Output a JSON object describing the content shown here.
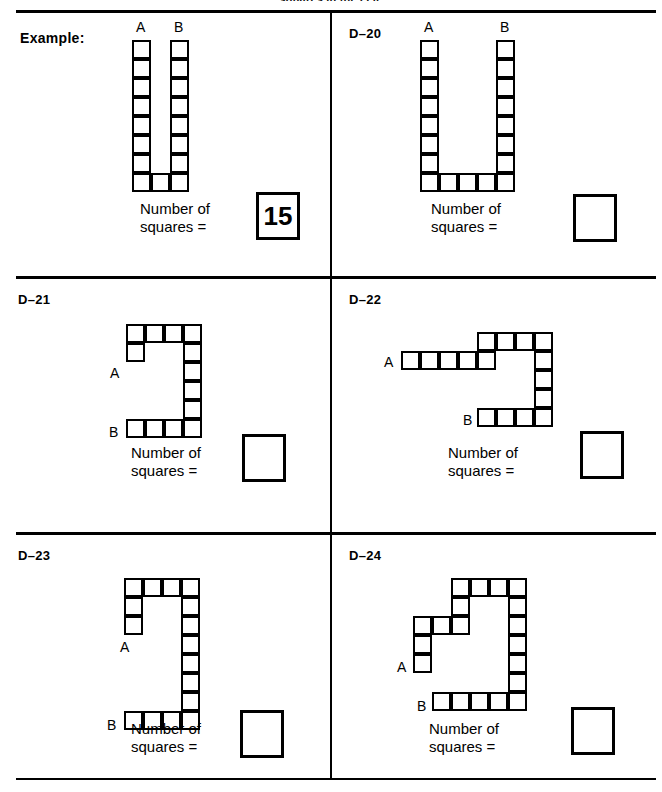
{
  "page": {
    "clipped_header": "squares in the cell.",
    "rule_color": "#000000",
    "paper_color": "#ffffff"
  },
  "prompt_text": "Number of\nsquares =",
  "labels": {
    "a": "A",
    "b": "B"
  },
  "cells": [
    {
      "id": "example",
      "label": "Example:",
      "answer": "15",
      "answer_filled": true,
      "marker_a": "A",
      "marker_b": "B"
    },
    {
      "id": "d20",
      "label": "D–20",
      "answer": "",
      "answer_filled": false,
      "marker_a": "A",
      "marker_b": "B"
    },
    {
      "id": "d21",
      "label": "D–21",
      "answer": "",
      "answer_filled": false,
      "marker_a": "A",
      "marker_b": "B"
    },
    {
      "id": "d22",
      "label": "D–22",
      "answer": "",
      "answer_filled": false,
      "marker_a": "A",
      "marker_b": "B"
    },
    {
      "id": "d23",
      "label": "D–23",
      "answer": "",
      "answer_filled": false,
      "marker_a": "A",
      "marker_b": "B"
    },
    {
      "id": "d24",
      "label": "D–24",
      "answer": "",
      "answer_filled": false,
      "marker_a": "A",
      "marker_b": "B"
    }
  ],
  "chart_data": {
    "type": "table",
    "cell_size_px": 19,
    "figures": [
      {
        "id": "example",
        "label": "Example:",
        "grid_cols": 3,
        "grid_rows": 8,
        "cells": [
          [
            0,
            0
          ],
          [
            0,
            1
          ],
          [
            0,
            2
          ],
          [
            0,
            3
          ],
          [
            0,
            4
          ],
          [
            0,
            5
          ],
          [
            0,
            6
          ],
          [
            0,
            7
          ],
          [
            1,
            7
          ],
          [
            2,
            0
          ],
          [
            2,
            1
          ],
          [
            2,
            2
          ],
          [
            2,
            3
          ],
          [
            2,
            4
          ],
          [
            2,
            5
          ],
          [
            2,
            6
          ],
          [
            2,
            7
          ]
        ],
        "count": 17,
        "answer_shown": "15",
        "marker_a_cell": [
          0,
          0
        ],
        "marker_b_cell": [
          2,
          0
        ]
      },
      {
        "id": "d20",
        "label": "D–20",
        "grid_cols": 5,
        "grid_rows": 8,
        "cells": [
          [
            0,
            0
          ],
          [
            0,
            1
          ],
          [
            0,
            2
          ],
          [
            0,
            3
          ],
          [
            0,
            4
          ],
          [
            0,
            5
          ],
          [
            0,
            6
          ],
          [
            0,
            7
          ],
          [
            1,
            7
          ],
          [
            2,
            7
          ],
          [
            3,
            7
          ],
          [
            4,
            0
          ],
          [
            4,
            1
          ],
          [
            4,
            2
          ],
          [
            4,
            3
          ],
          [
            4,
            4
          ],
          [
            4,
            5
          ],
          [
            4,
            6
          ],
          [
            4,
            7
          ]
        ],
        "count": 19,
        "answer_shown": "",
        "marker_a_cell": [
          0,
          0
        ],
        "marker_b_cell": [
          4,
          0
        ]
      },
      {
        "id": "d21",
        "label": "D–21",
        "grid_cols": 4,
        "grid_rows": 6,
        "cells": [
          [
            0,
            0
          ],
          [
            1,
            0
          ],
          [
            2,
            0
          ],
          [
            3,
            0
          ],
          [
            0,
            1
          ],
          [
            3,
            1
          ],
          [
            3,
            2
          ],
          [
            3,
            3
          ],
          [
            3,
            4
          ],
          [
            0,
            5
          ],
          [
            1,
            5
          ],
          [
            2,
            5
          ],
          [
            3,
            5
          ]
        ],
        "count": 13,
        "answer_shown": "",
        "marker_a_cell": [
          0,
          1
        ],
        "marker_b_cell": [
          0,
          5
        ]
      },
      {
        "id": "d22",
        "label": "D–22",
        "grid_cols": 8,
        "grid_rows": 6,
        "cells": [
          [
            4,
            0
          ],
          [
            5,
            0
          ],
          [
            6,
            0
          ],
          [
            7,
            0
          ],
          [
            0,
            1
          ],
          [
            1,
            1
          ],
          [
            2,
            1
          ],
          [
            3,
            1
          ],
          [
            4,
            1
          ],
          [
            7,
            1
          ],
          [
            7,
            2
          ],
          [
            7,
            3
          ],
          [
            4,
            4
          ],
          [
            5,
            4
          ],
          [
            6,
            4
          ],
          [
            7,
            4
          ]
        ],
        "count": 16,
        "answer_shown": "",
        "marker_a_cell": [
          0,
          1
        ],
        "marker_b_cell": [
          4,
          4
        ]
      },
      {
        "id": "d23",
        "label": "D–23",
        "grid_cols": 4,
        "grid_rows": 8,
        "cells": [
          [
            0,
            0
          ],
          [
            1,
            0
          ],
          [
            2,
            0
          ],
          [
            3,
            0
          ],
          [
            0,
            1
          ],
          [
            3,
            1
          ],
          [
            0,
            2
          ],
          [
            3,
            2
          ],
          [
            3,
            3
          ],
          [
            3,
            4
          ],
          [
            3,
            5
          ],
          [
            3,
            6
          ],
          [
            0,
            7
          ],
          [
            1,
            7
          ],
          [
            2,
            7
          ],
          [
            3,
            7
          ]
        ],
        "count": 16,
        "answer_shown": "",
        "marker_a_cell": [
          0,
          3
        ],
        "marker_b_cell": [
          0,
          7
        ]
      },
      {
        "id": "d24",
        "label": "D–24",
        "grid_cols": 6,
        "grid_rows": 8,
        "cells": [
          [
            2,
            0
          ],
          [
            3,
            0
          ],
          [
            4,
            0
          ],
          [
            5,
            0
          ],
          [
            2,
            1
          ],
          [
            5,
            1
          ],
          [
            0,
            2
          ],
          [
            1,
            2
          ],
          [
            2,
            2
          ],
          [
            5,
            2
          ],
          [
            0,
            3
          ],
          [
            5,
            3
          ],
          [
            0,
            4
          ],
          [
            5,
            4
          ],
          [
            5,
            5
          ],
          [
            1,
            6
          ],
          [
            2,
            6
          ],
          [
            3,
            6
          ],
          [
            4,
            6
          ],
          [
            5,
            6
          ]
        ],
        "count": 20,
        "answer_shown": "",
        "marker_a_cell": [
          0,
          4
        ],
        "marker_b_cell": [
          1,
          6
        ]
      }
    ]
  }
}
